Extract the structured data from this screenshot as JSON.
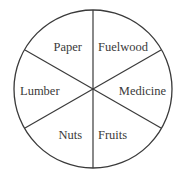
{
  "diagram": {
    "type": "pie-divided-circle",
    "segments": [
      {
        "label": "Paper",
        "position": "upper-left"
      },
      {
        "label": "Fuelwood",
        "position": "upper-right"
      },
      {
        "label": "Medicine",
        "position": "right"
      },
      {
        "label": "Fruits",
        "position": "lower-right"
      },
      {
        "label": "Nuts",
        "position": "lower-left"
      },
      {
        "label": "Lumber",
        "position": "left"
      }
    ],
    "colors": {
      "stroke": "#3a3a3a",
      "fill": "#ffffff",
      "text": "#3a3a3a"
    }
  }
}
